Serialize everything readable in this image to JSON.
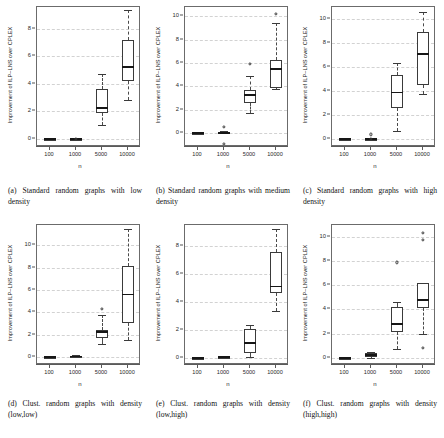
{
  "figure": {
    "axis_labels": {
      "y": "Improvement of ILP–LNS over CPLEX",
      "x": "n"
    },
    "x_categories": [
      "100",
      "1000",
      "5000",
      "10000"
    ]
  },
  "chart_data": [
    {
      "type": "box",
      "panel_id": "a",
      "caption": "(a) Standard random graphs with low density",
      "title": "",
      "xlabel": "n",
      "ylabel": "Improvement of ILP–LNS over CPLEX",
      "categories": [
        "100",
        "1000",
        "5000",
        "10000"
      ],
      "ylim": [
        -0.6,
        9.6
      ],
      "yticks": [
        0,
        2,
        4,
        6,
        8
      ],
      "grid": true,
      "boxes": [
        {
          "category": "100",
          "min": 0.0,
          "q1": 0.0,
          "median": 0.0,
          "q3": 0.0,
          "max": 0.0,
          "outliers": []
        },
        {
          "category": "1000",
          "min": 0.0,
          "q1": 0.0,
          "median": 0.0,
          "q3": 0.0,
          "max": 0.0,
          "outliers": [
            0.0
          ]
        },
        {
          "category": "5000",
          "min": 1.0,
          "q1": 1.9,
          "median": 2.25,
          "q3": 3.65,
          "max": 4.75,
          "outliers": []
        },
        {
          "category": "10000",
          "min": 2.8,
          "q1": 4.2,
          "median": 5.2,
          "q3": 7.2,
          "max": 9.35,
          "outliers": []
        }
      ]
    },
    {
      "type": "box",
      "panel_id": "b",
      "caption": "(b) Standard random graphs with medium density",
      "title": "",
      "xlabel": "n",
      "ylabel": "Improvement of ILP–LNS over CPLEX",
      "categories": [
        "100",
        "1000",
        "5000",
        "10000"
      ],
      "ylim": [
        -1.2,
        10.8
      ],
      "yticks": [
        0,
        2,
        4,
        6,
        8,
        10
      ],
      "grid": true,
      "boxes": [
        {
          "category": "100",
          "min": 0.0,
          "q1": 0.0,
          "median": 0.0,
          "q3": 0.0,
          "max": 0.0,
          "outliers": []
        },
        {
          "category": "1000",
          "min": 0.0,
          "q1": 0.0,
          "median": 0.0,
          "q3": 0.1,
          "max": 0.15,
          "outliers": [
            0.5,
            -0.9
          ]
        },
        {
          "category": "5000",
          "min": 1.7,
          "q1": 2.6,
          "median": 3.25,
          "q3": 3.7,
          "max": 4.85,
          "outliers": [
            5.95
          ]
        },
        {
          "category": "10000",
          "min": 3.75,
          "q1": 3.9,
          "median": 5.5,
          "q3": 6.3,
          "max": 9.45,
          "outliers": [
            10.2
          ]
        }
      ]
    },
    {
      "type": "box",
      "panel_id": "c",
      "caption": "(c) Standard random graphs with high density",
      "title": "",
      "xlabel": "n",
      "ylabel": "Improvement of ILP–LNS over CPLEX",
      "categories": [
        "100",
        "1000",
        "5000",
        "10000"
      ],
      "ylim": [
        -0.7,
        11.0
      ],
      "yticks": [
        0,
        2,
        4,
        6,
        8,
        10
      ],
      "grid": true,
      "boxes": [
        {
          "category": "100",
          "min": 0.0,
          "q1": 0.0,
          "median": 0.0,
          "q3": 0.0,
          "max": 0.0,
          "outliers": []
        },
        {
          "category": "1000",
          "min": 0.0,
          "q1": 0.0,
          "median": 0.0,
          "q3": 0.0,
          "max": 0.0,
          "outliers": [
            0.35,
            0.0
          ]
        },
        {
          "category": "5000",
          "min": 0.6,
          "q1": 2.6,
          "median": 3.85,
          "q3": 5.3,
          "max": 6.35,
          "outliers": []
        },
        {
          "category": "10000",
          "min": 3.7,
          "q1": 4.5,
          "median": 7.1,
          "q3": 8.9,
          "max": 10.6,
          "outliers": []
        }
      ]
    },
    {
      "type": "box",
      "panel_id": "d",
      "caption": "(d) Clust. random graphs with density (low,low)",
      "title": "",
      "xlabel": "n",
      "ylabel": "Improvement of ILP–LNS over CPLEX",
      "categories": [
        "100",
        "1000",
        "5000",
        "10000"
      ],
      "ylim": [
        -0.7,
        11.8
      ],
      "yticks": [
        0,
        2,
        4,
        6,
        8,
        10
      ],
      "grid": true,
      "boxes": [
        {
          "category": "100",
          "min": 0.0,
          "q1": 0.0,
          "median": 0.0,
          "q3": 0.0,
          "max": 0.0,
          "outliers": []
        },
        {
          "category": "1000",
          "min": 0.0,
          "q1": 0.0,
          "median": 0.05,
          "q3": 0.1,
          "max": 0.15,
          "outliers": []
        },
        {
          "category": "5000",
          "min": 1.15,
          "q1": 1.7,
          "median": 2.25,
          "q3": 2.45,
          "max": 3.75,
          "outliers": [
            4.3
          ]
        },
        {
          "category": "10000",
          "min": 1.55,
          "q1": 3.05,
          "median": 5.6,
          "q3": 8.1,
          "max": 11.45,
          "outliers": []
        }
      ]
    },
    {
      "type": "box",
      "panel_id": "e",
      "caption": "(e) Clust. random graphs with density (low,high)",
      "title": "",
      "xlabel": "n",
      "ylabel": "Improvement of ILP–LNS over CPLEX",
      "categories": [
        "100",
        "1000",
        "5000",
        "10000"
      ],
      "ylim": [
        -0.5,
        9.5
      ],
      "yticks": [
        0,
        2,
        4,
        6,
        8
      ],
      "grid": true,
      "boxes": [
        {
          "category": "100",
          "min": 0.0,
          "q1": 0.0,
          "median": 0.0,
          "q3": 0.0,
          "max": 0.0,
          "outliers": []
        },
        {
          "category": "1000",
          "min": 0.0,
          "q1": 0.0,
          "median": 0.05,
          "q3": 0.1,
          "max": 0.12,
          "outliers": []
        },
        {
          "category": "5000",
          "min": 0.1,
          "q1": 0.35,
          "median": 1.05,
          "q3": 2.1,
          "max": 2.35,
          "outliers": []
        },
        {
          "category": "10000",
          "min": 3.35,
          "q1": 4.65,
          "median": 5.1,
          "q3": 7.6,
          "max": 9.25,
          "outliers": []
        }
      ]
    },
    {
      "type": "box",
      "panel_id": "f",
      "caption": "(f) Clust. random graphs with density (high,high)",
      "title": "",
      "xlabel": "n",
      "ylabel": "Improvement of ILP–LNS over CPLEX",
      "categories": [
        "100",
        "1000",
        "5000",
        "10000"
      ],
      "ylim": [
        -0.6,
        11.0
      ],
      "yticks": [
        0,
        2,
        4,
        6,
        8,
        10
      ],
      "grid": true,
      "boxes": [
        {
          "category": "100",
          "min": 0.0,
          "q1": 0.0,
          "median": 0.0,
          "q3": 0.0,
          "max": 0.0,
          "outliers": []
        },
        {
          "category": "1000",
          "min": 0.0,
          "q1": 0.05,
          "median": 0.2,
          "q3": 0.4,
          "max": 0.5,
          "outliers": []
        },
        {
          "category": "5000",
          "min": 0.7,
          "q1": 2.15,
          "median": 2.8,
          "q3": 4.2,
          "max": 4.6,
          "outliers": [
            7.9
          ]
        },
        {
          "category": "10000",
          "min": 1.95,
          "q1": 4.1,
          "median": 4.8,
          "q3": 6.2,
          "max": 6.2,
          "outliers": [
            10.35,
            9.75,
            0.85
          ]
        }
      ]
    }
  ]
}
